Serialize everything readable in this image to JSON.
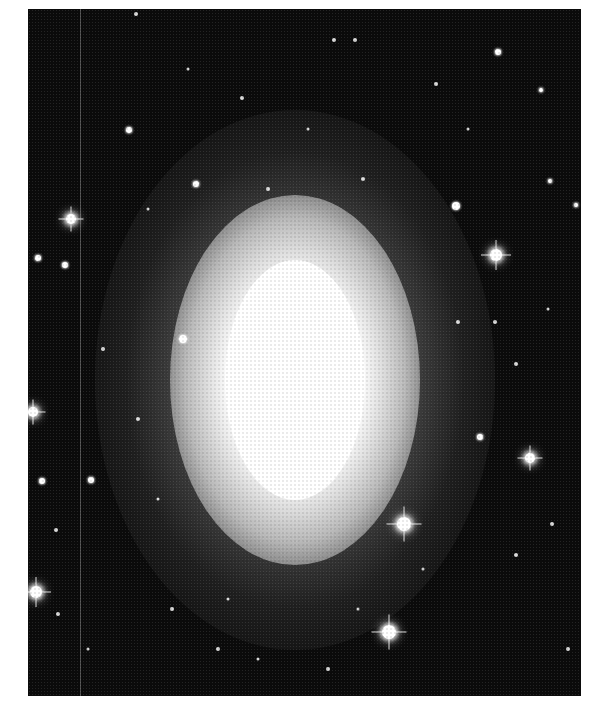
{
  "image": {
    "subject": "elliptical galaxy",
    "style": "grayscale astronomical photograph",
    "frame": {
      "left": 28,
      "top": 9,
      "width": 553,
      "height": 687
    },
    "colors": {
      "sky": "#0b0b0b",
      "page": "#ffffff",
      "core": "#ffffff"
    }
  },
  "galaxy": {
    "center": {
      "x": 267,
      "y": 371
    },
    "core": {
      "rx": 70,
      "ry": 120
    },
    "halo_mid": {
      "rx": 125,
      "ry": 185
    },
    "halo_outer": {
      "rx": 200,
      "ry": 270
    }
  },
  "scan_line_x": 52,
  "stars": [
    {
      "x": 468,
      "y": 246,
      "size": "big",
      "r": 6
    },
    {
      "x": 376,
      "y": 515,
      "size": "big",
      "r": 7
    },
    {
      "x": 361,
      "y": 623,
      "size": "big",
      "r": 7
    },
    {
      "x": 8,
      "y": 583,
      "size": "big",
      "r": 6
    },
    {
      "x": 43,
      "y": 210,
      "size": "big",
      "r": 5
    },
    {
      "x": 502,
      "y": 449,
      "size": "big",
      "r": 5
    },
    {
      "x": 5,
      "y": 403,
      "size": "big",
      "r": 5
    },
    {
      "x": 155,
      "y": 330,
      "size": "med",
      "r": 4
    },
    {
      "x": 428,
      "y": 197,
      "size": "med",
      "r": 4
    },
    {
      "x": 470,
      "y": 43,
      "size": "med",
      "r": 3
    },
    {
      "x": 10,
      "y": 249,
      "size": "med",
      "r": 3
    },
    {
      "x": 37,
      "y": 256,
      "size": "med",
      "r": 3
    },
    {
      "x": 14,
      "y": 472,
      "size": "med",
      "r": 3
    },
    {
      "x": 63,
      "y": 471,
      "size": "med",
      "r": 3
    },
    {
      "x": 101,
      "y": 121,
      "size": "med",
      "r": 3
    },
    {
      "x": 168,
      "y": 175,
      "size": "med",
      "r": 3
    },
    {
      "x": 452,
      "y": 428,
      "size": "med",
      "r": 3
    },
    {
      "x": 522,
      "y": 172,
      "size": "med",
      "r": 2
    },
    {
      "x": 548,
      "y": 196,
      "size": "med",
      "r": 2
    },
    {
      "x": 513,
      "y": 81,
      "size": "med",
      "r": 2
    },
    {
      "x": 28,
      "y": 521,
      "size": "small",
      "r": 2
    },
    {
      "x": 30,
      "y": 605,
      "size": "small",
      "r": 2
    },
    {
      "x": 108,
      "y": 5,
      "size": "small",
      "r": 2
    },
    {
      "x": 306,
      "y": 31,
      "size": "small",
      "r": 2
    },
    {
      "x": 327,
      "y": 31,
      "size": "small",
      "r": 2
    },
    {
      "x": 214,
      "y": 89,
      "size": "small",
      "r": 2
    },
    {
      "x": 408,
      "y": 75,
      "size": "small",
      "r": 2
    },
    {
      "x": 430,
      "y": 313,
      "size": "small",
      "r": 2
    },
    {
      "x": 467,
      "y": 313,
      "size": "small",
      "r": 2
    },
    {
      "x": 488,
      "y": 355,
      "size": "small",
      "r": 2
    },
    {
      "x": 524,
      "y": 515,
      "size": "small",
      "r": 2
    },
    {
      "x": 488,
      "y": 546,
      "size": "small",
      "r": 2
    },
    {
      "x": 144,
      "y": 600,
      "size": "small",
      "r": 2
    },
    {
      "x": 240,
      "y": 180,
      "size": "small",
      "r": 2
    },
    {
      "x": 335,
      "y": 170,
      "size": "small",
      "r": 2
    },
    {
      "x": 75,
      "y": 340,
      "size": "small",
      "r": 2
    },
    {
      "x": 110,
      "y": 410,
      "size": "small",
      "r": 2
    },
    {
      "x": 190,
      "y": 640,
      "size": "small",
      "r": 2
    },
    {
      "x": 300,
      "y": 660,
      "size": "small",
      "r": 2
    },
    {
      "x": 540,
      "y": 640,
      "size": "small",
      "r": 2
    },
    {
      "x": 230,
      "y": 650,
      "size": "small",
      "r": 1.5
    },
    {
      "x": 60,
      "y": 640,
      "size": "small",
      "r": 1.5
    },
    {
      "x": 120,
      "y": 200,
      "size": "small",
      "r": 1.5
    },
    {
      "x": 395,
      "y": 560,
      "size": "small",
      "r": 1.5
    },
    {
      "x": 520,
      "y": 300,
      "size": "small",
      "r": 1.5
    },
    {
      "x": 440,
      "y": 120,
      "size": "small",
      "r": 1.5
    },
    {
      "x": 160,
      "y": 60,
      "size": "small",
      "r": 1.5
    },
    {
      "x": 280,
      "y": 120,
      "size": "small",
      "r": 1.5
    },
    {
      "x": 130,
      "y": 490,
      "size": "small",
      "r": 1.5
    },
    {
      "x": 200,
      "y": 590,
      "size": "small",
      "r": 1.5
    },
    {
      "x": 330,
      "y": 600,
      "size": "small",
      "r": 1.5
    },
    {
      "x": 290,
      "y": 690,
      "size": "small",
      "r": 2
    }
  ]
}
